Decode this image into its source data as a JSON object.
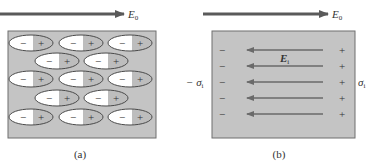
{
  "colors": {
    "box_fill": "#c4c4c4",
    "box_stroke": "#6f6f6f",
    "arrow": "#5a5a5a",
    "ellipse_stroke": "#4a4a4a",
    "text": "#333333"
  },
  "panel_a": {
    "caption": "(a)",
    "field_label": "E",
    "field_subscript": "0",
    "dipole_minus": "−",
    "dipole_plus": "+",
    "dipole_rows": [
      3,
      2,
      3,
      2,
      3
    ]
  },
  "panel_b": {
    "caption": "(b)",
    "field_label": "E",
    "field_subscript": "0",
    "internal_field_label": "E",
    "internal_field_subscript": "i",
    "left_charge": "−",
    "right_charge": "+",
    "left_density_label": "− σ",
    "left_density_subscript": "i",
    "right_density_label": "σ",
    "right_density_subscript": "i",
    "arrow_rows": 5
  }
}
